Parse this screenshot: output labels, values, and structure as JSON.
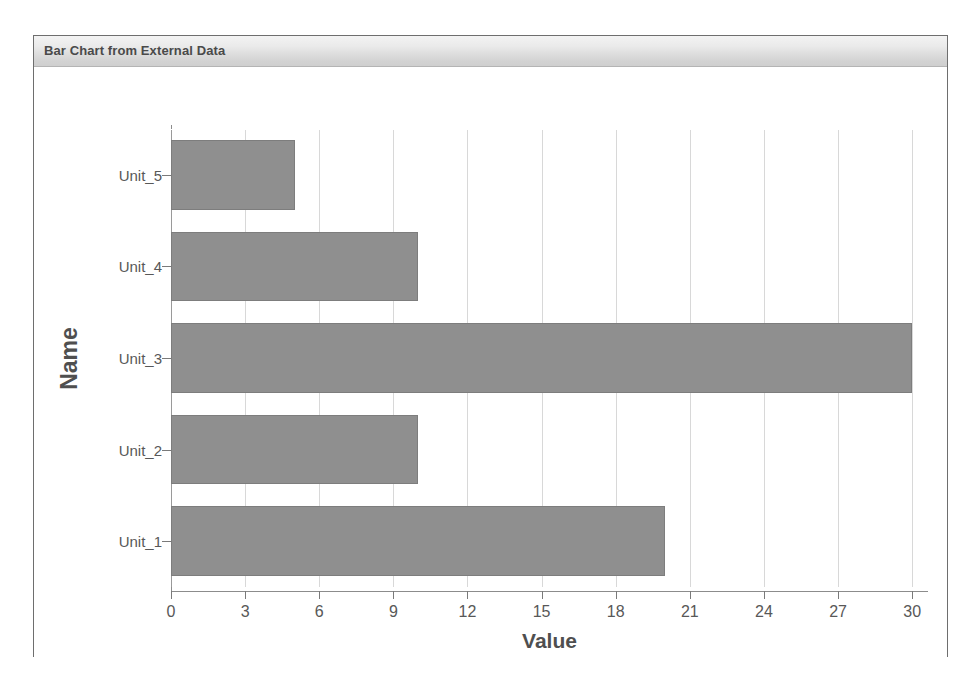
{
  "panel": {
    "title": "Bar Chart from External Data"
  },
  "colors": {
    "bar_fill": "#8f8f8f",
    "bar_stroke": "#7d7d7d",
    "gridline": "#d8d8d8",
    "axis": "#8c8c8c",
    "title_text": "#4a4a4a",
    "tick_text": "#585858"
  },
  "chart_data": {
    "type": "bar",
    "orientation": "horizontal",
    "title": "Bar Chart from External Data",
    "xlabel": "Value",
    "ylabel": "Name",
    "categories": [
      "Unit_1",
      "Unit_2",
      "Unit_3",
      "Unit_4",
      "Unit_5"
    ],
    "values": [
      20,
      10,
      30,
      10,
      5
    ],
    "xlim": [
      0,
      30.6
    ],
    "xticks": [
      0,
      3,
      6,
      9,
      12,
      15,
      18,
      21,
      24,
      27,
      30
    ],
    "xtick_labels": [
      "0",
      "3",
      "6",
      "9",
      "12",
      "15",
      "18",
      "21",
      "24",
      "27",
      "30"
    ],
    "ytick_labels_top_to_bottom": [
      "Unit_5",
      "Unit_4",
      "Unit_3",
      "Unit_2",
      "Unit_1"
    ],
    "grid": true,
    "grid_axis": "x",
    "legend": false
  }
}
